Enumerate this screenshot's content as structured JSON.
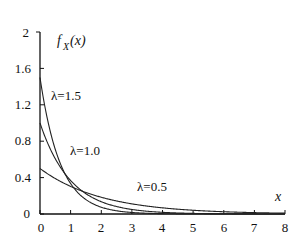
{
  "chart_data": {
    "type": "line",
    "title": "",
    "xlabel": "x",
    "ylabel": "f_X(x)",
    "xlim": [
      0,
      8
    ],
    "ylim": [
      0,
      2
    ],
    "grid": false,
    "legend_position": "none (inline annotations)",
    "x_ticks": [
      "0",
      "1",
      "2",
      "3",
      "4",
      "5",
      "6",
      "7",
      "8"
    ],
    "y_ticks": [
      "0",
      "0.4",
      "0.8",
      "1.2",
      "1.6",
      "2"
    ],
    "x": [
      0,
      0.5,
      1,
      1.5,
      2,
      2.5,
      3,
      3.5,
      4,
      4.5,
      5,
      5.5,
      6,
      6.5,
      7,
      7.5,
      8
    ],
    "series": [
      {
        "name": "λ=1.5",
        "lambda": 1.5,
        "values": [
          1.5,
          0.708,
          0.335,
          0.158,
          0.075,
          0.035,
          0.017,
          0.008,
          0.004,
          0.002,
          0.001,
          0.0004,
          0.0002,
          0.0001,
          0.0,
          0.0,
          0.0
        ]
      },
      {
        "name": "λ=1.0",
        "lambda": 1.0,
        "values": [
          1.0,
          0.607,
          0.368,
          0.223,
          0.135,
          0.082,
          0.05,
          0.03,
          0.018,
          0.011,
          0.007,
          0.004,
          0.002,
          0.002,
          0.001,
          0.001,
          0.0003
        ]
      },
      {
        "name": "λ=0.5",
        "lambda": 0.5,
        "values": [
          0.5,
          0.389,
          0.303,
          0.236,
          0.184,
          0.143,
          0.112,
          0.087,
          0.068,
          0.053,
          0.041,
          0.032,
          0.025,
          0.019,
          0.015,
          0.012,
          0.009
        ]
      }
    ],
    "annotations": [
      {
        "text": "λ=1.5",
        "x": 0.35,
        "y": 1.3
      },
      {
        "text": "λ=1.0",
        "x": 0.95,
        "y": 0.7
      },
      {
        "text": "λ=0.5",
        "x": 3.15,
        "y": 0.3
      }
    ]
  },
  "labels": {
    "y_axis_main": "f",
    "y_axis_sub": "X",
    "y_axis_arg": "(x)",
    "x_axis": "x",
    "ann_15": "λ=1.5",
    "ann_10": "λ=1.0",
    "ann_05": "λ=0.5",
    "xt0": "0",
    "xt1": "1",
    "xt2": "2",
    "xt3": "3",
    "xt4": "4",
    "xt5": "5",
    "xt6": "6",
    "xt7": "7",
    "xt8": "8",
    "yt0": "0",
    "yt1": "0.4",
    "yt2": "0.8",
    "yt3": "1.2",
    "yt4": "1.6",
    "yt5": "2"
  },
  "colors": {
    "line": "#222222",
    "axis": "#111111",
    "background": "#ffffff"
  }
}
